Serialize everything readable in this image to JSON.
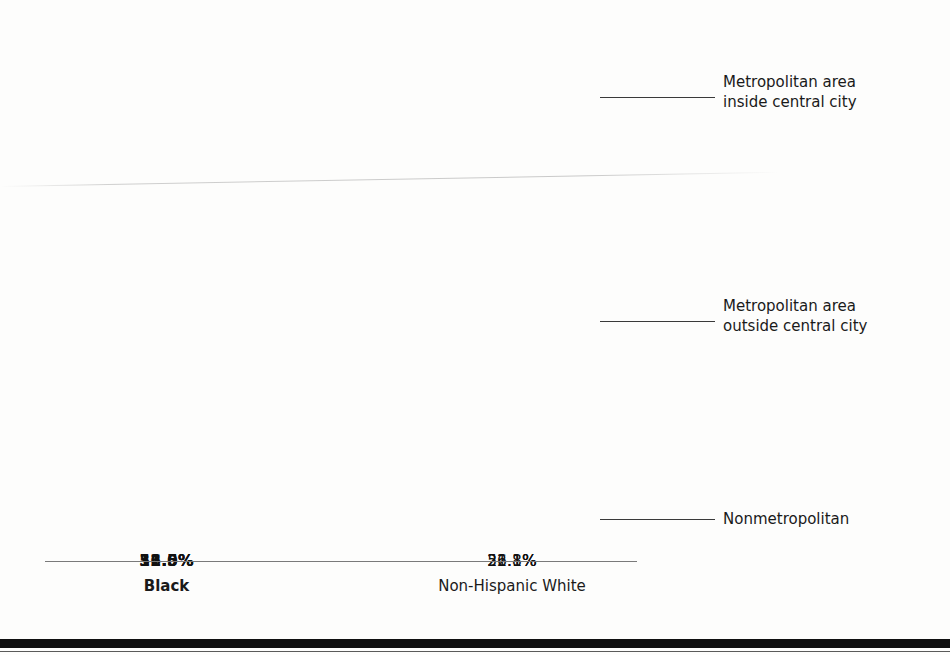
{
  "chart_data": {
    "type": "bar",
    "subtype": "stacked-bar-100",
    "title": "",
    "xlabel": "",
    "ylabel": "",
    "ylim": [
      0,
      100
    ],
    "grid": false,
    "legend_position": "right-callout",
    "units": "percent",
    "categories": [
      "Black",
      "Non-Hispanic White"
    ],
    "series": [
      {
        "name": "Metropolitan area inside central city",
        "values": [
          51.5,
          21.1
        ],
        "labels": [
          "51.5%",
          "21.1%"
        ],
        "color": "#7e7e7e"
      },
      {
        "name": "Metropolitan area outside central city",
        "values": [
          36.0,
          56.8
        ],
        "labels": [
          "36.0%",
          "56.8%"
        ],
        "color": "#b4b4b4"
      },
      {
        "name": "Nonmetropolitan",
        "values": [
          12.5,
          22.1
        ],
        "labels": [
          "12.5%",
          "22.1%"
        ],
        "color": "#8d8d8d"
      }
    ]
  },
  "axis": {
    "category_labels": [
      {
        "text": "Black",
        "bold": true
      },
      {
        "text": "Non-Hispanic White",
        "bold": false
      }
    ]
  },
  "callouts": [
    {
      "id": "inside",
      "text": "Metropolitan area\ninside central city"
    },
    {
      "id": "outside",
      "text": "Metropolitan area\noutside central city"
    },
    {
      "id": "nonmetro",
      "text": "Nonmetropolitan"
    }
  ],
  "bars": {
    "black": {
      "segments": [
        {
          "label": "51.5%",
          "bold": true,
          "height_pct": 54.0,
          "color": "#7e7e7e"
        },
        {
          "label": "36.0%",
          "bold": true,
          "height_pct": 37.3,
          "color": "#b4b4b4"
        },
        {
          "label": "12.5%",
          "bold": true,
          "height_pct": 8.7,
          "color": "#8d8d8d"
        }
      ]
    },
    "nhwhite": {
      "segments": [
        {
          "label": "21.1%",
          "bold": false,
          "height_pct": 22.5,
          "color": "#7e7e7e"
        },
        {
          "label": "56.8%",
          "bold": false,
          "height_pct": 58.4,
          "color": "#b4b4b4"
        },
        {
          "label": "22.1%",
          "bold": false,
          "height_pct": 19.1,
          "color": "#8d8d8d"
        }
      ]
    }
  },
  "colors": {
    "segment_dark": "#7e7e7e",
    "segment_light": "#b4b4b4",
    "segment_mid": "#8d8d8d",
    "axis": "#7a7a7a",
    "text": "#1a1a1a",
    "rule": "#101010"
  }
}
